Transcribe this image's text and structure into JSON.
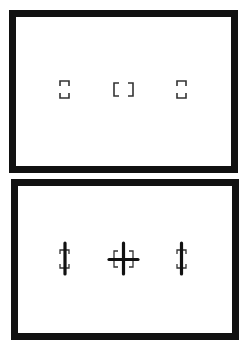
{
  "diagram": {
    "type": "viewfinder-af-points",
    "colors": {
      "frame": "#111111",
      "bracket": "#333333",
      "line": "#111111",
      "background": "#ffffff"
    },
    "panels": [
      {
        "id": "top",
        "frame": {
          "x": 9,
          "y": 10,
          "w": 229,
          "h": 163,
          "border": 7
        },
        "points": [
          {
            "name": "left",
            "kind": "vertical-bracket",
            "x": 59,
            "y": 80,
            "w": 11,
            "h": 19
          },
          {
            "name": "center",
            "kind": "horizontal-bracket",
            "x": 113,
            "y": 82,
            "w": 21,
            "h": 15
          },
          {
            "name": "right",
            "kind": "vertical-bracket",
            "x": 176,
            "y": 80,
            "w": 11,
            "h": 19
          }
        ]
      },
      {
        "id": "bottom",
        "frame": {
          "x": 11,
          "y": 179,
          "w": 228,
          "h": 161,
          "border": 7
        },
        "points": [
          {
            "name": "left",
            "kind": "vertical-bracket-with-line",
            "x": 59,
            "y": 243,
            "w": 11,
            "h": 31
          },
          {
            "name": "center",
            "kind": "cross-with-bracket",
            "x": 109,
            "y": 243,
            "w": 29,
            "h": 31
          },
          {
            "name": "right",
            "kind": "vertical-bracket-with-line",
            "x": 176,
            "y": 243,
            "w": 11,
            "h": 31
          }
        ]
      }
    ]
  }
}
